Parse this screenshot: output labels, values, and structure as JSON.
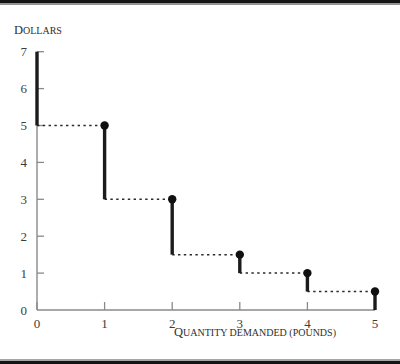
{
  "chart_data": {
    "type": "line",
    "title": "",
    "subtitle": "",
    "xlabel_lead": "Q",
    "xlabel_rest": "UANTITY DEMANDED (POUNDS)",
    "xlabel": "QUANTITY DEMANDED (POUNDS)",
    "ylabel_lead": "D",
    "ylabel_rest": "OLLARS",
    "ylabel": "DOLLARS",
    "xlim": [
      0,
      5
    ],
    "ylim": [
      0,
      7
    ],
    "xticks": [
      0,
      1,
      2,
      3,
      4,
      5
    ],
    "xticklabels": [
      "0",
      "1",
      "2",
      "3",
      "4",
      "5"
    ],
    "yticks": [
      0,
      1,
      2,
      3,
      4,
      5,
      6,
      7
    ],
    "yticklabels": [
      "0",
      "1",
      "2",
      "3",
      "4",
      "5",
      "6",
      "7"
    ],
    "grid": false,
    "legend": false,
    "legend_position": "none",
    "series": [
      {
        "name": "Demand schedule",
        "style": "step-function",
        "riser_color": "#1b1b1b",
        "tread_color": "#2a2a2a",
        "tread_dashed": true,
        "steps": [
          {
            "x_start": 0,
            "x_end": 1,
            "price": 5,
            "riser_top": 7,
            "riser_bottom": 5
          },
          {
            "x_start": 1,
            "x_end": 2,
            "price": 3,
            "riser_top": 5,
            "riser_bottom": 3
          },
          {
            "x_start": 2,
            "x_end": 3,
            "price": 1.5,
            "riser_top": 3,
            "riser_bottom": 1.5
          },
          {
            "x_start": 3,
            "x_end": 4,
            "price": 1,
            "riser_top": 1.5,
            "riser_bottom": 1
          },
          {
            "x_start": 4,
            "x_end": 5,
            "price": 0.5,
            "riser_top": 1,
            "riser_bottom": 0.5
          }
        ],
        "points": [
          {
            "x": 1,
            "y": 5
          },
          {
            "x": 2,
            "y": 3
          },
          {
            "x": 3,
            "y": 1.5
          },
          {
            "x": 4,
            "y": 1
          },
          {
            "x": 5,
            "y": 0.5
          }
        ]
      }
    ],
    "annotations": []
  },
  "colors": {
    "background": "#ffffff",
    "axis": "#8a8a8a",
    "ink": "#1b1b1b",
    "label": "#3d3d3d",
    "edge_band": "#141414"
  },
  "geometry": {
    "x0_px": 37,
    "x_unit_px": 67.6,
    "y0_px": 310,
    "y_unit_px": 36.9,
    "y_top_px": 52,
    "dot_radius_px": 4.2
  }
}
